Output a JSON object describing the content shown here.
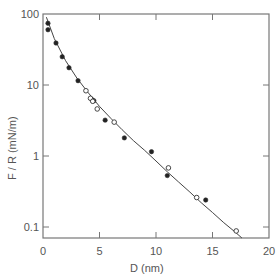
{
  "chart_data": {
    "type": "scatter",
    "title": "",
    "xlabel": "D  (nm)",
    "ylabel": "F / R  (mN/m)",
    "xlim": [
      0,
      20
    ],
    "ylim": [
      0.08,
      100
    ],
    "yscale": "log",
    "x_ticks": [
      0,
      5,
      10,
      15,
      20
    ],
    "x_tick_labels": [
      "0",
      "5",
      "10",
      "15",
      "20"
    ],
    "y_ticks": [
      0.1,
      1,
      10,
      100
    ],
    "y_tick_labels": [
      "0.1",
      "1",
      "10",
      "100"
    ],
    "grid": false,
    "legend": null,
    "series": [
      {
        "name": "filled circles",
        "marker": "filled-circle",
        "points": [
          [
            0.44,
            74
          ],
          [
            0.44,
            60
          ],
          [
            1.15,
            39
          ],
          [
            1.7,
            25
          ],
          [
            2.3,
            17.5
          ],
          [
            3.1,
            11.5
          ],
          [
            4.35,
            6.2
          ],
          [
            4.5,
            6.0
          ],
          [
            5.5,
            3.2
          ],
          [
            7.2,
            1.8
          ],
          [
            9.6,
            1.15
          ],
          [
            11.0,
            0.53
          ],
          [
            14.4,
            0.24
          ]
        ]
      },
      {
        "name": "open circles",
        "marker": "open-circle",
        "points": [
          [
            3.8,
            8.3
          ],
          [
            4.2,
            6.5
          ],
          [
            4.4,
            5.9
          ],
          [
            4.8,
            4.6
          ],
          [
            6.3,
            3.0
          ],
          [
            11.1,
            0.68
          ],
          [
            13.6,
            0.26
          ],
          [
            17.1,
            0.088
          ]
        ]
      },
      {
        "name": "fitted curve",
        "marker": "line",
        "points": [
          [
            0.3,
            90
          ],
          [
            1,
            45
          ],
          [
            2,
            22
          ],
          [
            3,
            12.5
          ],
          [
            4,
            7.8
          ],
          [
            5,
            5.0
          ],
          [
            6,
            3.4
          ],
          [
            7,
            2.35
          ],
          [
            8,
            1.65
          ],
          [
            9,
            1.2
          ],
          [
            10,
            0.85
          ],
          [
            11,
            0.6
          ],
          [
            12,
            0.43
          ],
          [
            13,
            0.31
          ],
          [
            14,
            0.22
          ],
          [
            15,
            0.16
          ],
          [
            16,
            0.115
          ],
          [
            17,
            0.085
          ],
          [
            17.6,
            0.07
          ]
        ]
      }
    ]
  },
  "axes": {
    "x_title": "D  (nm)",
    "y_title": "F / R  (mN/m)"
  }
}
